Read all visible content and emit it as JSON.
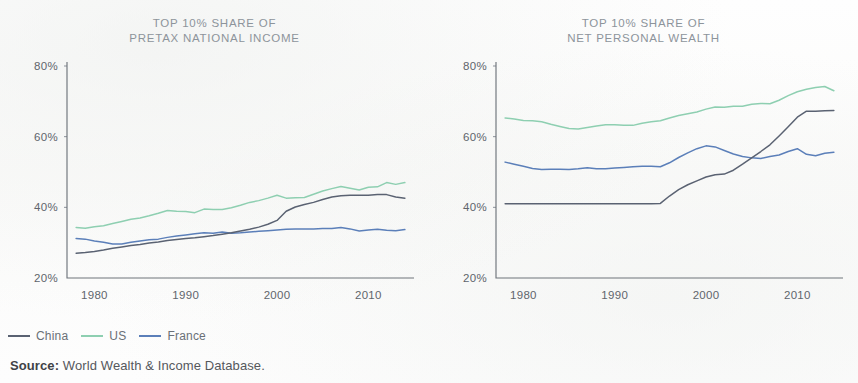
{
  "figure": {
    "source_label": "Source:",
    "source_text": " World Wealth & Income Database."
  },
  "legend": {
    "position": "bottom-left",
    "items": [
      {
        "label": "China",
        "color": "#5a6272"
      },
      {
        "label": "US",
        "color": "#8ecfb1"
      },
      {
        "label": "France",
        "color": "#5b7fb9"
      }
    ]
  },
  "panels": [
    {
      "id": "pretax-national-income",
      "title_line1": "TOP 10% SHARE OF",
      "title_line2": "PRETAX NATIONAL INCOME"
    },
    {
      "id": "net-personal-wealth",
      "title_line1": "TOP 10% SHARE OF",
      "title_line2": "NET PERSONAL WEALTH"
    }
  ],
  "chart_data": [
    {
      "type": "line",
      "title": "TOP 10% SHARE OF PRETAX NATIONAL INCOME",
      "xlabel": "",
      "ylabel": "",
      "xlim": [
        1977,
        2015
      ],
      "ylim": [
        20,
        80
      ],
      "yticks": [
        20,
        40,
        60,
        80
      ],
      "ytick_labels": [
        "20%",
        "40%",
        "60%",
        "80%"
      ],
      "xticks": [
        1980,
        1990,
        2000,
        2010
      ],
      "xtick_labels": [
        "1980",
        "1990",
        "2000",
        "2010"
      ],
      "grid": false,
      "legend_position": "below-figure",
      "x": [
        1978,
        1979,
        1980,
        1981,
        1982,
        1983,
        1984,
        1985,
        1986,
        1987,
        1988,
        1989,
        1990,
        1991,
        1992,
        1993,
        1994,
        1995,
        1996,
        1997,
        1998,
        1999,
        2000,
        2001,
        2002,
        2003,
        2004,
        2005,
        2006,
        2007,
        2008,
        2009,
        2010,
        2011,
        2012,
        2013,
        2014
      ],
      "series": [
        {
          "name": "China",
          "color": "#5a6272",
          "values": [
            27.0,
            27.2,
            27.5,
            27.9,
            28.4,
            28.8,
            29.2,
            29.5,
            29.9,
            30.2,
            30.6,
            30.9,
            31.2,
            31.4,
            31.7,
            32.0,
            32.4,
            32.8,
            33.3,
            33.8,
            34.4,
            35.2,
            36.3,
            38.9,
            40.1,
            40.8,
            41.4,
            42.2,
            42.9,
            43.3,
            43.4,
            43.4,
            43.4,
            43.6,
            43.6,
            42.9,
            42.6
          ]
        },
        {
          "name": "US",
          "color": "#8ecfb1",
          "values": [
            34.3,
            34.1,
            34.5,
            34.8,
            35.4,
            36.0,
            36.6,
            37.0,
            37.6,
            38.3,
            39.1,
            38.9,
            38.8,
            38.5,
            39.5,
            39.4,
            39.4,
            39.9,
            40.6,
            41.4,
            41.9,
            42.6,
            43.4,
            42.6,
            42.7,
            42.8,
            43.7,
            44.6,
            45.3,
            45.9,
            45.4,
            44.9,
            45.7,
            45.8,
            47.0,
            46.5,
            47.0
          ]
        },
        {
          "name": "France",
          "color": "#5b7fb9",
          "values": [
            31.2,
            31.0,
            30.5,
            30.1,
            29.6,
            29.6,
            30.1,
            30.5,
            30.8,
            31.0,
            31.5,
            31.9,
            32.2,
            32.5,
            32.8,
            32.7,
            33.0,
            32.7,
            32.8,
            33.0,
            33.2,
            33.4,
            33.6,
            33.8,
            33.9,
            33.9,
            33.9,
            34.0,
            34.0,
            34.3,
            33.9,
            33.3,
            33.6,
            33.8,
            33.5,
            33.4,
            33.7
          ]
        }
      ]
    },
    {
      "type": "line",
      "title": "TOP 10% SHARE OF NET PERSONAL WEALTH",
      "xlabel": "",
      "ylabel": "",
      "xlim": [
        1977,
        2015
      ],
      "ylim": [
        20,
        80
      ],
      "yticks": [
        20,
        40,
        60,
        80
      ],
      "ytick_labels": [
        "20%",
        "40%",
        "60%",
        "80%"
      ],
      "xticks": [
        1980,
        1990,
        2000,
        2010
      ],
      "xtick_labels": [
        "1980",
        "1990",
        "2000",
        "2010"
      ],
      "grid": false,
      "legend_position": "below-figure",
      "x": [
        1978,
        1979,
        1980,
        1981,
        1982,
        1983,
        1984,
        1985,
        1986,
        1987,
        1988,
        1989,
        1990,
        1991,
        1992,
        1993,
        1994,
        1995,
        1996,
        1997,
        1998,
        1999,
        2000,
        2001,
        2002,
        2003,
        2004,
        2005,
        2006,
        2007,
        2008,
        2009,
        2010,
        2011,
        2012,
        2013,
        2014
      ],
      "series": [
        {
          "name": "China",
          "color": "#5a6272",
          "values": [
            41.0,
            41.0,
            41.0,
            41.0,
            41.0,
            41.0,
            41.0,
            41.0,
            41.0,
            41.0,
            41.0,
            41.0,
            41.0,
            41.0,
            41.0,
            41.0,
            41.0,
            41.1,
            43.2,
            45.0,
            46.4,
            47.5,
            48.6,
            49.2,
            49.4,
            50.5,
            52.2,
            54.0,
            55.8,
            57.7,
            60.2,
            62.8,
            65.5,
            67.2,
            67.2,
            67.3,
            67.4
          ]
        },
        {
          "name": "US",
          "color": "#8ecfb1",
          "values": [
            65.3,
            65.0,
            64.6,
            64.5,
            64.2,
            63.5,
            62.9,
            62.3,
            62.2,
            62.6,
            63.0,
            63.4,
            63.4,
            63.2,
            63.2,
            63.8,
            64.2,
            64.5,
            65.3,
            66.0,
            66.5,
            67.0,
            67.8,
            68.4,
            68.3,
            68.6,
            68.6,
            69.2,
            69.4,
            69.3,
            70.3,
            71.6,
            72.7,
            73.4,
            73.9,
            74.2,
            73.0
          ]
        },
        {
          "name": "France",
          "color": "#5b7fb9",
          "values": [
            52.8,
            52.2,
            51.6,
            51.0,
            50.7,
            50.8,
            50.8,
            50.7,
            50.9,
            51.2,
            50.9,
            50.9,
            51.1,
            51.3,
            51.5,
            51.6,
            51.6,
            51.5,
            52.6,
            54.1,
            55.4,
            56.6,
            57.4,
            57.1,
            56.1,
            55.1,
            54.4,
            54.0,
            53.8,
            54.4,
            54.8,
            55.8,
            56.6,
            55.0,
            54.6,
            55.3,
            55.6
          ]
        }
      ]
    }
  ]
}
